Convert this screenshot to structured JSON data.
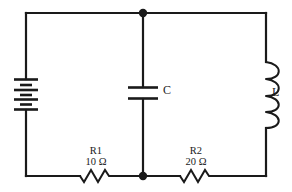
{
  "diagram": {
    "background_color": "#ffffff",
    "line_color": "#1a1a1a",
    "components": {
      "battery": {
        "name": "battery",
        "label": "",
        "cells": 4,
        "orientation": "vertical",
        "branch": "left"
      },
      "capacitor": {
        "name": "capacitor",
        "label": "C",
        "plates": 2,
        "orientation": "vertical",
        "branch": "center"
      },
      "inductor": {
        "name": "inductor",
        "label": "L",
        "loops": 4,
        "orientation": "vertical",
        "branch": "right"
      },
      "resistor1": {
        "name": "resistor-r1",
        "label": "R1",
        "value": "10 Ω",
        "orientation": "horizontal",
        "branch": "bottom-left"
      },
      "resistor2": {
        "name": "resistor-r2",
        "label": "R2",
        "value": "20 Ω",
        "orientation": "horizontal",
        "branch": "bottom-right"
      }
    },
    "nodes": [
      {
        "name": "top-junction",
        "x": 143,
        "y": 13
      },
      {
        "name": "bottom-junction",
        "x": 143,
        "y": 176
      }
    ]
  }
}
